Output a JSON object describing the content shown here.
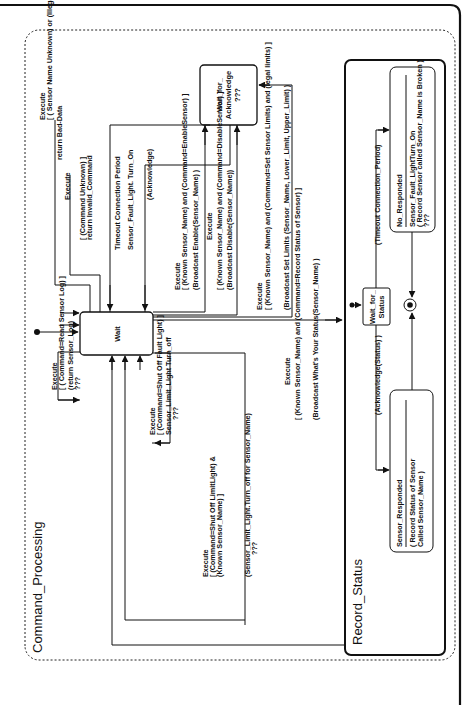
{
  "diagram": {
    "type": "UML state machine (rotated 90° counter-clockwise)",
    "outer_composite": {
      "name": "Command_Processing"
    },
    "states": {
      "wait": {
        "name": "Wait"
      },
      "wait_for_ack": {
        "line1": "Wait_for_",
        "line2": "Acknowledge",
        "line3": "???"
      },
      "record_status": {
        "name": "Record_Status"
      },
      "wait_for_status": {
        "line1": "Wait_for_",
        "line2": "Status"
      },
      "no_responded": {
        "name": "No_Responded",
        "action1": "Sensor_Fault_LightTurn_On",
        "action2": "( Record Sensor called Sensor_Name is Broken )",
        "action3": "???"
      },
      "sensor_responded": {
        "name": "Sensor_Responded",
        "action1": "( Record Status of Sensor",
        "action2": "Called Sensor_Name )"
      }
    },
    "transitions": {
      "read_log": {
        "l1": "Execute",
        "l2": "[ ( Command=Read Sensor Log) ]",
        "l3": "(return Sensor_Log)",
        "l4": "???"
      },
      "bad_data": {
        "l1": "Execute",
        "l2": "[ ( Sensor Name Unknown) or (Illegal Limits) ]",
        "l3": "return Bad-Data"
      },
      "invalid_cmd": {
        "l1": "Execute",
        "l2": "[ (Command Unknown) ]",
        "l3": "return Invalid_Command"
      },
      "timeout": {
        "l1": "Timeout Connection Period",
        "l2": "Sensor_Fault_Light. Turn_On"
      },
      "acknowledge": {
        "l1": "(Acknowledge)"
      },
      "enable": {
        "l1": "Execute",
        "l2": "[ (Known Sensor_Name) and (Command=EnableSensor) ]",
        "l3": "(Broadcast Enable(Sensor_Name) )"
      },
      "disable": {
        "l1": "Execute",
        "l2": "[ (Known Sensor_Name) and (Command=DisableSensor) ]",
        "l3": "(Broadcast Disable(Sensor_Name))"
      },
      "set_limits": {
        "l1": "Execute",
        "l2": "[ (Known Sensor_Name) and (Command=Set Sensor Limits) and (legal limits) ]",
        "l3": "(Broadcast Set Limits (Sensor_Name, Lower_Limit, Upper_Limit) )"
      },
      "record_status": {
        "l1": "Execute",
        "l2": "[ (Known Sensor_Name) and (Command=Record Status of Sensor) ]",
        "l3": "(Broadcast What's Your Status(Sensor_Name) )"
      },
      "fault_off": {
        "l1": "Execute",
        "l2": "[ (Command=Shut Off Fault Light) ]",
        "l3": "Sensor_Limit_Light Turn_off",
        "l4": "???"
      },
      "limit_off": {
        "l1": "Execute",
        "l2": "[ (Command=Shut Off LimitLight) &",
        "l3": "(Known Sensor_Name) ]",
        "l4": "(Sensor_Limit_Light.Turn_off for Sensor_Name)",
        "l5": "???"
      },
      "ack_status": {
        "l1": "(Acknowledge(Status) )"
      },
      "timeout_period": {
        "l1": "(Timeout Connection_Period)"
      }
    }
  }
}
